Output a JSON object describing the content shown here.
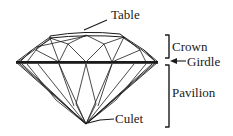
{
  "diagram": {
    "labels": {
      "table": "Table",
      "crown": "Crown",
      "girdle": "Girdle",
      "pavilion": "Pavilion",
      "culet": "Culet"
    },
    "colors": {
      "stroke": "#1a1a1a",
      "background": "#ffffff"
    }
  }
}
